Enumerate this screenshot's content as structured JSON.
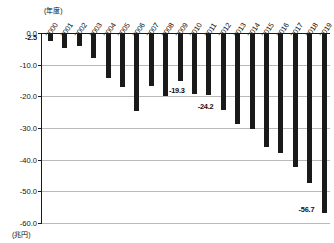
{
  "chart_data": {
    "type": "bar",
    "title": "",
    "xlabel": "(年度)",
    "ylabel": "(兆円)",
    "categories": [
      "2000",
      "2001",
      "2002",
      "2003",
      "2004",
      "2005",
      "2006",
      "2007",
      "2008",
      "2009",
      "2010",
      "2011",
      "2012",
      "2013",
      "2014",
      "2015",
      "2016",
      "2017",
      "2018",
      "2019"
    ],
    "values": [
      -2.5,
      -4.6,
      -4.1,
      -8.0,
      -14.2,
      -17.0,
      -24.5,
      -16.8,
      -19.8,
      -15.2,
      -19.3,
      -19.6,
      -24.2,
      -28.6,
      -30.4,
      -36.0,
      -37.8,
      -42.3,
      -47.4,
      -56.7
    ],
    "ylim": [
      -60.0,
      0.0
    ],
    "yticks": [
      "0.0",
      "-10.0",
      "-20.0",
      "-30.0",
      "-40.0",
      "-50.0",
      "-60.0"
    ],
    "ytick_values": [
      0.0,
      -10.0,
      -20.0,
      -30.0,
      -40.0,
      -50.0,
      -60.0
    ],
    "grid": true,
    "legend": "none",
    "annotations": [
      {
        "label": "-2.5",
        "category": "2000",
        "value": -2.5
      },
      {
        "label": "-19.3",
        "category": "2010",
        "value": -19.3
      },
      {
        "label": "-24.2",
        "category": "2012",
        "value": -24.2
      },
      {
        "label": "-56.7",
        "category": "2019",
        "value": -56.7
      }
    ],
    "bar_color": "#1a1a1a",
    "grid_color": "#b9b9b9",
    "axis_color": "#1a1a1a"
  },
  "axes": {
    "x_unit_label": "(年度)",
    "y_unit_label": "(兆円)"
  }
}
